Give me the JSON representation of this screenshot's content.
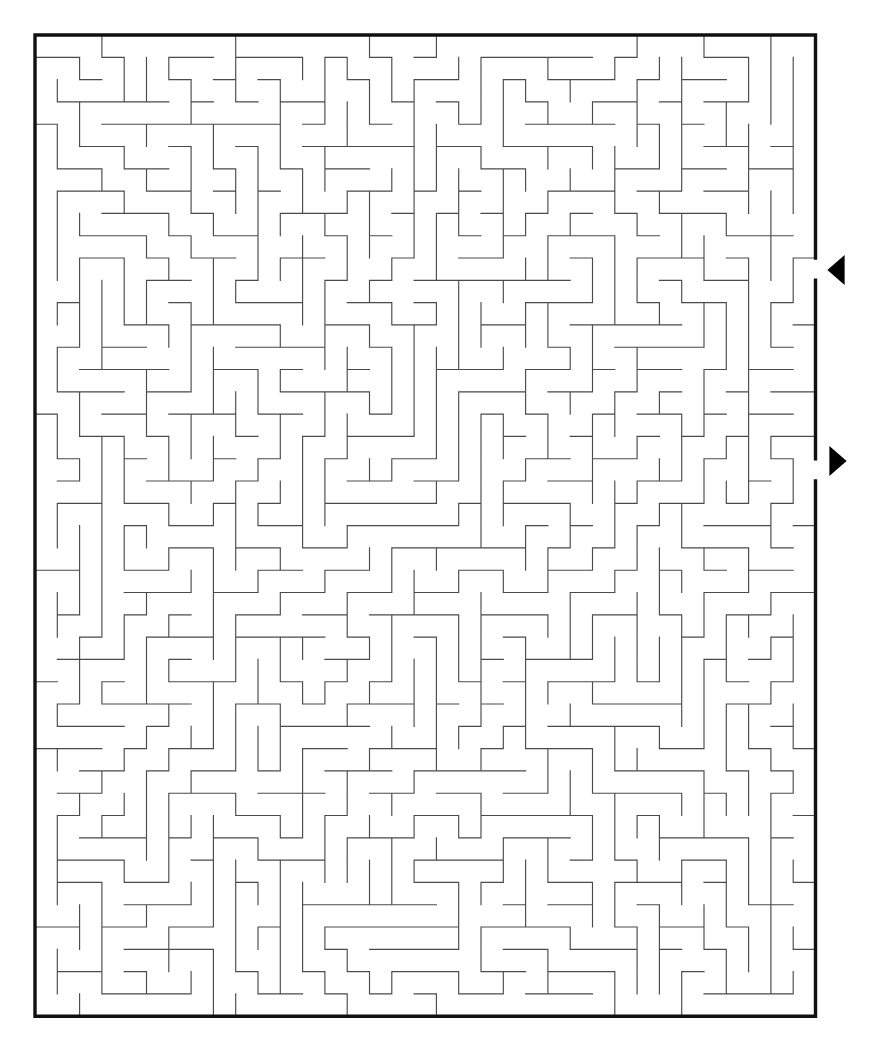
{
  "document": {
    "type": "maze-puzzle",
    "title": "Rectangular Maze Puzzle",
    "background_color": "#ffffff"
  },
  "maze": {
    "columns": 35,
    "rows": 44,
    "cell_size": 22.3,
    "origin_x": 35,
    "origin_y": 35,
    "width_px": 780.5,
    "height_px": 981.2,
    "border_color": "#101010",
    "border_width": 3.4,
    "wall_color": "#4a4a4a",
    "wall_width": 1.15,
    "seed": 20240517,
    "algorithm": "recursive-backtracker"
  },
  "entrance": {
    "label": "entrance",
    "side": "right",
    "row": 10,
    "arrow_direction": "left",
    "arrow_x": 836,
    "arrow_y": 270,
    "arrow_size": 15,
    "color": "#000000"
  },
  "exit": {
    "label": "exit",
    "side": "right",
    "row": 19,
    "arrow_direction": "right",
    "arrow_x": 826,
    "arrow_y": 461,
    "arrow_size": 15,
    "color": "#000000"
  },
  "accessibility": {
    "alt_text": "A black and white rectangular maze with a left-pointing solid triangle marking the entrance on the right side and a right-pointing solid triangle marking the exit lower on the right side."
  }
}
